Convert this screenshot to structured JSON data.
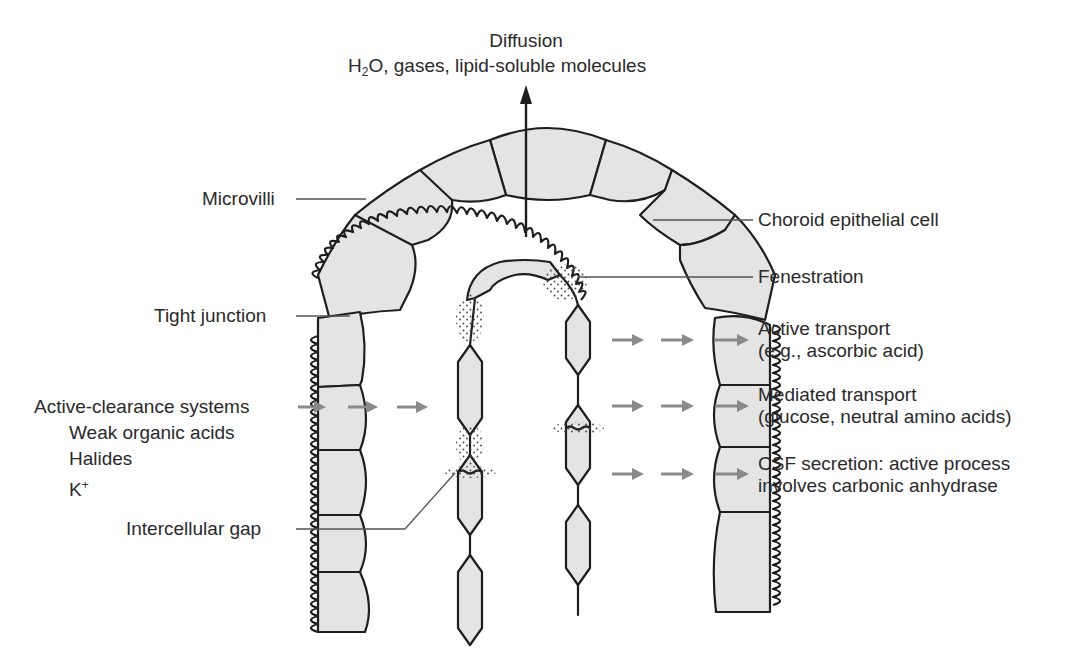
{
  "diagram": {
    "type": "anatomical-illustration",
    "top_label": {
      "title": "Diffusion",
      "line2_prefix": "H",
      "line2_sub": "2",
      "line2_suffix": "O, gases, lipid-soluble molecules"
    },
    "left_labels": {
      "microvilli": "Microvilli",
      "tight_junction": "Tight junction",
      "active_clearance": "Active-clearance systems",
      "weak_acids": "Weak organic acids",
      "halides": "Halides",
      "potassium_base": "K",
      "potassium_sup": "+",
      "intercellular_gap": "Intercellular gap"
    },
    "right_labels": {
      "choroid_cell": "Choroid epithelial cell",
      "fenestration": "Fenestration",
      "active_transport_1": "Active transport",
      "active_transport_2": "(e.g., ascorbic acid)",
      "mediated_transport_1": "Mediated transport",
      "mediated_transport_2": "(glucose, neutral amino acids)",
      "csf_secretion_1": "CSF secretion: active process",
      "csf_secretion_2": "involves carbonic anhydrase"
    },
    "colors": {
      "cell_fill": "#e4e4e4",
      "outline": "#1e1e1e",
      "arrow_gray": "#8a8a8a",
      "text": "#2a2a2a"
    }
  }
}
